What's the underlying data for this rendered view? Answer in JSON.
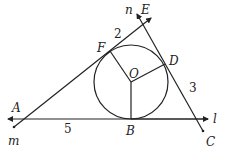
{
  "diagram": {
    "type": "geometry",
    "points": {
      "A": {
        "label": "A",
        "x": 19,
        "y": 113
      },
      "B": {
        "label": "B",
        "x": 131,
        "y": 119
      },
      "C": {
        "label": "C",
        "x": 203,
        "y": 131
      },
      "D": {
        "label": "D",
        "x": 165,
        "y": 64
      },
      "E": {
        "label": "E",
        "x": 143,
        "y": 24
      },
      "F": {
        "label": "F",
        "x": 110,
        "y": 51
      },
      "O": {
        "label": "O",
        "x": 131,
        "y": 82
      }
    },
    "lines": {
      "l": {
        "label": "l"
      },
      "m": {
        "label": "m"
      },
      "n": {
        "label": "n"
      }
    },
    "circle": {
      "center": "O",
      "radius": 37
    },
    "lengths": [
      {
        "segment": "EF",
        "value": "2"
      },
      {
        "segment": "DC",
        "value": "3"
      },
      {
        "segment": "AB",
        "value": "5"
      }
    ],
    "colors": {
      "stroke": "#222222",
      "background": "#ffffff"
    }
  }
}
